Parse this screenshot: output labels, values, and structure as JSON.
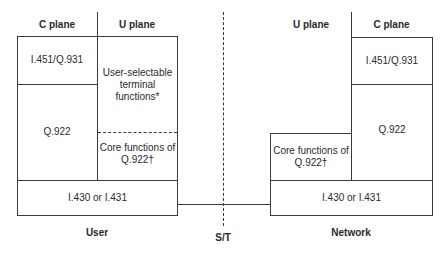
{
  "user_side": {
    "headers": {
      "c_plane": "C plane",
      "u_plane": "U plane"
    },
    "c_plane": {
      "layer3": "I.451/Q.931",
      "layer2": "Q.922"
    },
    "u_plane": {
      "upper": "User-selectable terminal functions*",
      "core": "Core functions of Q.922†"
    },
    "physical": "I.430 or I.431",
    "label": "User"
  },
  "reference_point": {
    "label": "S/T"
  },
  "network_side": {
    "headers": {
      "u_plane": "U plane",
      "c_plane": "C plane"
    },
    "c_plane": {
      "layer3": "I.451/Q.931",
      "layer2": "Q.922"
    },
    "u_plane": {
      "core": "Core functions of Q.922†"
    },
    "physical": "I.430 or I.431",
    "label": "Network"
  }
}
